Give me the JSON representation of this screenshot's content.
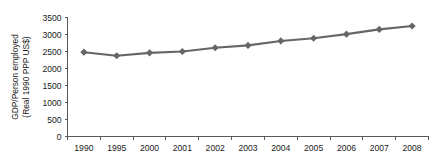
{
  "chart_data": {
    "type": "line",
    "title": "",
    "xlabel": "",
    "ylabel": "GDP/Person employed (Real 1990 PPP US$)",
    "ylabel_line1": "GDP/Person employed",
    "ylabel_line2": "(Real 1990 PPP US$)",
    "categories": [
      "1990",
      "1995",
      "2000",
      "2001",
      "2002",
      "2003",
      "2004",
      "2005",
      "2006",
      "2007",
      "2008"
    ],
    "values": [
      2480,
      2375,
      2460,
      2500,
      2610,
      2680,
      2810,
      2890,
      3010,
      3150,
      3250
    ],
    "series": [
      {
        "name": "GDP per person employed",
        "values": [
          2480,
          2375,
          2460,
          2500,
          2610,
          2680,
          2810,
          2890,
          3010,
          3150,
          3250
        ]
      }
    ],
    "ylim": [
      0,
      3500
    ],
    "ytick_values": [
      0,
      500,
      1000,
      1500,
      2000,
      2500,
      3000,
      3500
    ],
    "ytick_labels": [
      "0",
      "500",
      "1000",
      "1500",
      "2000",
      "2500",
      "3000",
      "3500"
    ],
    "xtick_labels": [
      "1990",
      "1995",
      "2000",
      "2001",
      "2002",
      "2003",
      "2004",
      "2005",
      "2006",
      "2007",
      "2008"
    ],
    "grid": false,
    "legend": false,
    "legend_position": "none",
    "series_color": "#666666",
    "marker": "diamond",
    "axis_color": "#5a5a5a",
    "text_color": "#1a1a1a",
    "background": "#ffffff"
  }
}
